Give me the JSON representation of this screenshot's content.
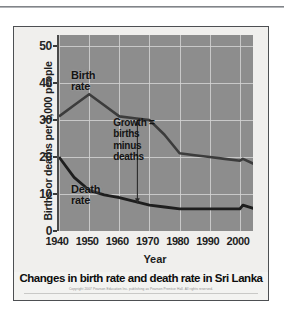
{
  "figure": {
    "caption": "Changes in birth rate and death rate in Sri Lanka",
    "credit": "Copyright 2007 Pearson Education Inc. publishing as Pearson Prentice Hall. All rights reserved."
  },
  "chart_data": {
    "type": "line",
    "title": "Changes in birth rate and death rate in Sri Lanka",
    "xlabel": "Year",
    "ylabel": "Births or deaths per 1,000 people",
    "xlim": [
      1940,
      2005
    ],
    "ylim": [
      0,
      53
    ],
    "xticks": [
      "1940",
      "1950",
      "1960",
      "1970",
      "1980",
      "1990",
      "2000"
    ],
    "yticks": [
      "0",
      "10",
      "20",
      "30",
      "40",
      "50"
    ],
    "grid": true,
    "legend_position": "inline-labels",
    "plot_background": "#8d8d8d",
    "gridline_color": "#d2d2d2",
    "series": [
      {
        "name": "Birth rate",
        "color": "#3c3c3c",
        "x": [
          1940,
          1945,
          1950,
          1955,
          1960,
          1965,
          1970,
          1975,
          1980,
          1985,
          1990,
          1995,
          2000,
          2001,
          2005
        ],
        "values": [
          31,
          34,
          37,
          34,
          31,
          30.5,
          30,
          26,
          21,
          20.5,
          20,
          19.5,
          19,
          19.5,
          18
        ]
      },
      {
        "name": "Death rate",
        "color": "#1e1e1e",
        "x": [
          1940,
          1945,
          1950,
          1955,
          1960,
          1965,
          1970,
          1975,
          1980,
          1985,
          1990,
          1995,
          2000,
          2001,
          2005
        ],
        "values": [
          20,
          14.5,
          11,
          9.8,
          9,
          8,
          7,
          6.5,
          6,
          6,
          6,
          6,
          6,
          7,
          6
        ]
      }
    ],
    "annotations": [
      {
        "name": "birth-rate-label",
        "text": "Birth\nrate",
        "x": 1944,
        "y": 42
      },
      {
        "name": "death-rate-label",
        "text": "Death\nrate",
        "x": 1944,
        "y": 11
      },
      {
        "name": "growth-note",
        "text": "Growth =\nbirths\nminus\ndeaths",
        "x": 1958,
        "y": 25
      },
      {
        "name": "growth-arrow",
        "text": "",
        "x": 1966,
        "y_top": 30,
        "y_bottom": 7.5
      }
    ]
  }
}
